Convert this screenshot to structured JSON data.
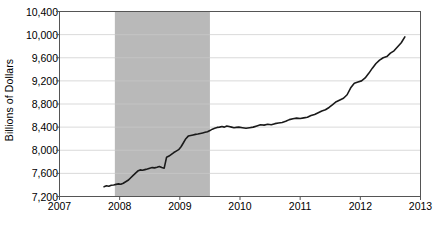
{
  "chart_data": {
    "type": "line",
    "title": "",
    "xlabel": "",
    "ylabel": "Billions of Dollars",
    "ylim": [
      7200,
      10400
    ],
    "xlim": [
      2007,
      2013
    ],
    "yticks": [
      7200,
      7600,
      8000,
      8400,
      8800,
      9200,
      9600,
      10000,
      10400
    ],
    "ytick_labels": [
      "7,200",
      "7,600",
      "8,000",
      "8,400",
      "8,800",
      "9,200",
      "9,600",
      "10,000",
      "10,400"
    ],
    "xticks": [
      2007,
      2008,
      2009,
      2010,
      2011,
      2012,
      2013
    ],
    "xtick_labels": [
      "2007",
      "2008",
      "2009",
      "2010",
      "2011",
      "2012",
      "2013"
    ],
    "grid": "horizontal",
    "legend": "none",
    "line_color": "#1a1a1a",
    "line_width": 1.6,
    "shaded_regions": [
      {
        "name": "recession-band",
        "x_start": 2007.92,
        "x_end": 2009.5,
        "color": "#b9b9b9",
        "label": ""
      }
    ],
    "series": [
      {
        "name": "Total Currency in Circulation",
        "x": [
          2007.74,
          2007.78,
          2007.82,
          2007.86,
          2007.9,
          2007.94,
          2007.98,
          2008.02,
          2008.06,
          2008.1,
          2008.14,
          2008.18,
          2008.22,
          2008.26,
          2008.3,
          2008.34,
          2008.38,
          2008.42,
          2008.46,
          2008.5,
          2008.54,
          2008.58,
          2008.62,
          2008.66,
          2008.7,
          2008.74,
          2008.78,
          2008.82,
          2008.86,
          2008.9,
          2008.94,
          2008.98,
          2009.02,
          2009.06,
          2009.1,
          2009.14,
          2009.18,
          2009.22,
          2009.26,
          2009.3,
          2009.34,
          2009.38,
          2009.42,
          2009.46,
          2009.5,
          2009.54,
          2009.58,
          2009.62,
          2009.66,
          2009.7,
          2009.74,
          2009.78,
          2009.82,
          2009.86,
          2009.9,
          2009.94,
          2009.98,
          2010.04,
          2010.1,
          2010.16,
          2010.22,
          2010.28,
          2010.34,
          2010.4,
          2010.46,
          2010.52,
          2010.58,
          2010.64,
          2010.7,
          2010.76,
          2010.82,
          2010.88,
          2010.94,
          2011.0,
          2011.06,
          2011.12,
          2011.18,
          2011.24,
          2011.3,
          2011.36,
          2011.42,
          2011.48,
          2011.54,
          2011.6,
          2011.66,
          2011.72,
          2011.78,
          2011.84,
          2011.9,
          2011.96,
          2012.02,
          2012.08,
          2012.14,
          2012.2,
          2012.26,
          2012.32,
          2012.38,
          2012.44,
          2012.5,
          2012.56,
          2012.62,
          2012.68,
          2012.74
        ],
        "y": [
          7370,
          7385,
          7378,
          7395,
          7400,
          7410,
          7418,
          7412,
          7430,
          7455,
          7480,
          7520,
          7560,
          7600,
          7640,
          7660,
          7655,
          7665,
          7675,
          7690,
          7700,
          7695,
          7705,
          7720,
          7700,
          7690,
          7880,
          7900,
          7930,
          7960,
          7985,
          8010,
          8060,
          8130,
          8200,
          8245,
          8255,
          8265,
          8275,
          8280,
          8290,
          8300,
          8310,
          8320,
          8340,
          8365,
          8380,
          8395,
          8400,
          8410,
          8400,
          8420,
          8410,
          8400,
          8390,
          8395,
          8400,
          8390,
          8380,
          8390,
          8400,
          8420,
          8440,
          8435,
          8450,
          8440,
          8460,
          8470,
          8480,
          8500,
          8530,
          8545,
          8555,
          8550,
          8560,
          8570,
          8600,
          8620,
          8650,
          8680,
          8700,
          8740,
          8790,
          8840,
          8870,
          8900,
          8960,
          9080,
          9160,
          9180,
          9200,
          9250,
          9330,
          9420,
          9500,
          9560,
          9600,
          9620,
          9680,
          9720,
          9790,
          9860,
          9960
        ],
        "last_value": 10180
      }
    ]
  }
}
